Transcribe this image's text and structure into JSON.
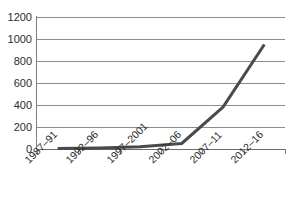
{
  "chart_data": {
    "type": "line",
    "title": "",
    "subtitle": "",
    "xlabel": "",
    "ylabel": "",
    "categories": [
      "1987–91",
      "1992–96",
      "1997–2001",
      "2002–06",
      "2007–11",
      "2012–16"
    ],
    "values": [
      5,
      10,
      20,
      50,
      380,
      950
    ],
    "series": [
      {
        "name": "",
        "values": [
          5,
          10,
          20,
          50,
          380,
          950
        ]
      }
    ],
    "ylim": [
      0,
      1200
    ],
    "y_ticks": [
      0,
      200,
      400,
      600,
      800,
      1000,
      1200
    ],
    "y_tick_labels": [
      "0",
      "200",
      "400",
      "600",
      "800",
      "1000",
      "1200"
    ],
    "grid": true,
    "grid_axis": "y",
    "legend": false,
    "legend_position": "none",
    "annotations": []
  },
  "style": {
    "line_color": "#4a4a4a",
    "grid_color": "#8c8c8c",
    "axis_color": "#7d7d7d",
    "text_color": "#2b2b2b",
    "background_color": "#ffffff",
    "line_width": 3
  }
}
